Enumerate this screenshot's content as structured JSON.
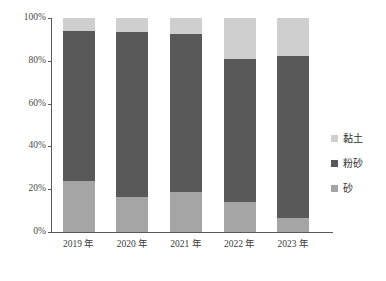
{
  "chart_data": {
    "type": "bar",
    "stacked": true,
    "stack_mode": "percent",
    "title": "",
    "subtitle": "",
    "xlabel": "",
    "ylabel": "",
    "categories": [
      "2019 年",
      "2020 年",
      "2021 年",
      "2022 年",
      "2023 年"
    ],
    "series": [
      {
        "name": "砂",
        "color": "#a5a5a5",
        "values": [
          24.0,
          16.4,
          18.7,
          14.0,
          6.5
        ]
      },
      {
        "name": "粉砂",
        "color": "#595959",
        "values": [
          70.0,
          77.1,
          73.8,
          66.8,
          75.7
        ]
      },
      {
        "name": "黏土",
        "color": "#cfcfcf",
        "values": [
          6.0,
          6.5,
          7.5,
          19.2,
          17.8
        ]
      }
    ],
    "cumulative_tops": {
      "砂": [
        24.0,
        16.4,
        18.7,
        14.0,
        6.5
      ],
      "粉砂": [
        94.0,
        93.5,
        92.5,
        80.8,
        82.2
      ],
      "黏土": [
        100.0,
        100.0,
        100.0,
        100.0,
        100.0
      ]
    },
    "ylim": [
      0,
      100
    ],
    "yticks": [
      0,
      20,
      40,
      60,
      80,
      100
    ],
    "ytick_labels": [
      "0%",
      "20%",
      "40%",
      "60%",
      "80%",
      "100%"
    ],
    "grid": false,
    "legend_position": "right",
    "legend_order": [
      "黏土",
      "粉砂",
      "砂"
    ]
  },
  "legend": {
    "items": [
      {
        "label": "黏土",
        "color": "#cfcfcf"
      },
      {
        "label": "粉砂",
        "color": "#595959"
      },
      {
        "label": "砂",
        "color": "#a5a5a5"
      }
    ]
  },
  "axis": {
    "y_labels": [
      "100%",
      "80%",
      "60%",
      "40%",
      "20%",
      "0%"
    ],
    "x_labels": [
      "2019 年",
      "2020 年",
      "2021 年",
      "2022 年",
      "2023 年"
    ]
  }
}
